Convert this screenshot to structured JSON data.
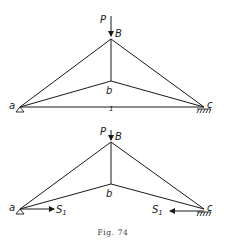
{
  "figure": {
    "caption": "Fig. 74",
    "colors": {
      "line": "#1a1a1a",
      "background": "#ffffff"
    },
    "top_truss": {
      "load_label": "P",
      "apex_label": "B",
      "inner_node_label": "b",
      "left_support_label": "a",
      "right_support_label": "c",
      "tie_marker": "1",
      "left_support_type": "roller-triangle",
      "right_support_type": "fixed-hatch"
    },
    "bottom_truss": {
      "load_label": "P",
      "apex_label": "B",
      "inner_node_label": "b",
      "left_support_label": "a",
      "right_support_label": "c",
      "left_force_label": "S",
      "left_force_subscript": "1",
      "right_force_label": "S",
      "right_force_subscript": "1",
      "left_support_type": "roller-triangle",
      "right_support_type": "fixed-hatch"
    }
  }
}
